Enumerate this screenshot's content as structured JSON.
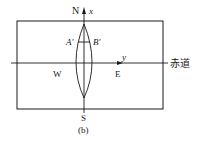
{
  "diagram": {
    "caption": "(b)",
    "labels": {
      "north": "N",
      "south": "S",
      "west": "W",
      "east": "E",
      "x_axis": "x",
      "y_axis": "y",
      "point_a": "A'",
      "point_b": "B'",
      "equator": "赤道"
    },
    "colors": {
      "line": "#1a1a1a",
      "background": "#ffffff"
    }
  }
}
